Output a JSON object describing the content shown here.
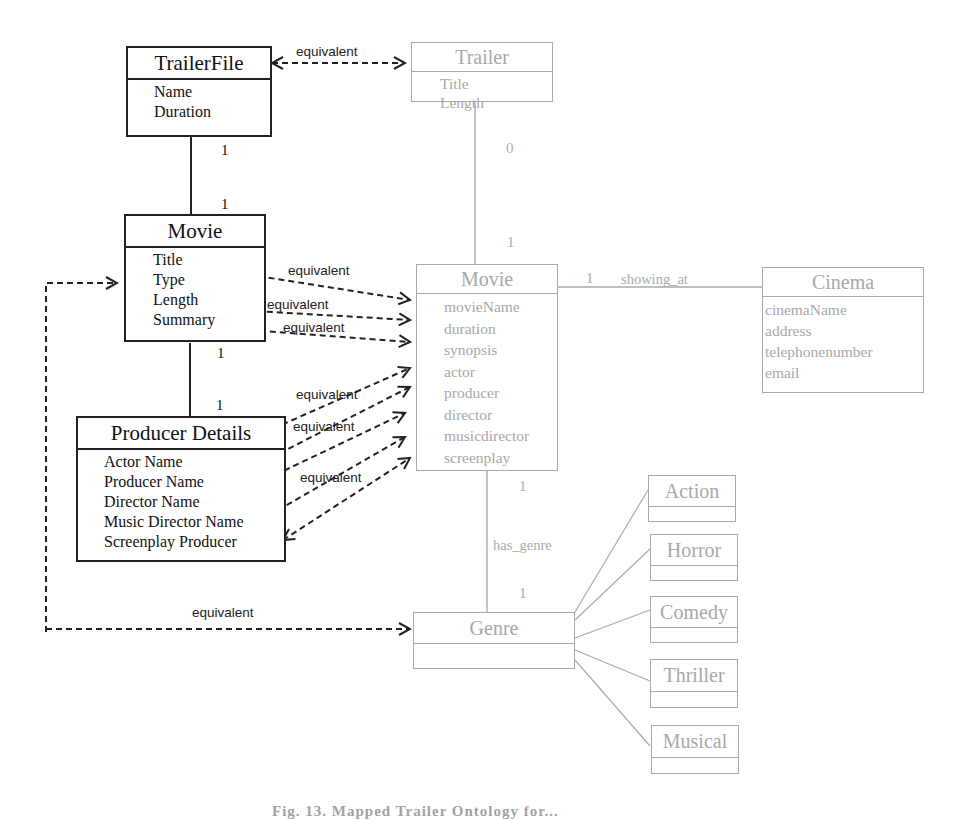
{
  "diagram": {
    "left_model": {
      "trailerfile": {
        "title": "TrailerFile",
        "attributes": [
          "Name",
          "Duration"
        ]
      },
      "movie": {
        "title": "Movie",
        "attributes": [
          "Title",
          "Type",
          "Length",
          "Summary"
        ]
      },
      "producer_details": {
        "title": "Producer Details",
        "attributes": [
          "Actor Name",
          "Producer Name",
          "Director Name",
          "Music Director Name",
          "Screenplay Producer"
        ]
      }
    },
    "right_model": {
      "trailer": {
        "title": "Trailer",
        "attributes": [
          "Title",
          "Length"
        ]
      },
      "movie": {
        "title": "Movie",
        "attributes": [
          "movieName",
          "duration",
          "synopsis",
          "actor",
          "producer",
          "director",
          "musicdirector",
          "screenplay"
        ]
      },
      "cinema": {
        "title": "Cinema",
        "attributes": [
          "cinemaName",
          "address",
          "telephonenumber",
          "email"
        ]
      },
      "genre": {
        "title": "Genre",
        "attributes": []
      },
      "subgenres": [
        {
          "title": "Action"
        },
        {
          "title": "Horror"
        },
        {
          "title": "Comedy"
        },
        {
          "title": "Thriller"
        },
        {
          "title": "Musical"
        }
      ]
    },
    "associations": {
      "showing_at": "showing_at",
      "has_genre": "has_genre"
    },
    "multiplicities": {
      "trailerfile_movie_top": "1",
      "trailerfile_movie_bottom": "1",
      "movie_producer_top": "1",
      "movie_producer_bottom": "1",
      "trailer_movie_top": "0",
      "trailer_movie_bottom": "1",
      "movie_cinema": "1",
      "movie_genre_top": "1",
      "movie_genre_bottom": "1"
    },
    "mapping_label": "equivalent",
    "mappings": [
      {
        "from": "TrailerFile",
        "to": "Trailer",
        "label": "equivalent"
      },
      {
        "from": "Movie.Title",
        "to": "Movie.movieName",
        "label": "equivalent"
      },
      {
        "from": "Movie.Length",
        "to": "Movie.duration",
        "label": "equivalent"
      },
      {
        "from": "Movie.Summary",
        "to": "Movie.synopsis",
        "label": "equivalent"
      },
      {
        "from": "Producer Details.Actor Name",
        "to": "Movie.actor",
        "label": "equivalent"
      },
      {
        "from": "Producer Details.Producer Name",
        "to": "Movie.producer",
        "label": "equivalent"
      },
      {
        "from": "Producer Details.Director Name",
        "to": "Movie.director",
        "label": ""
      },
      {
        "from": "Producer Details.Music Director Name",
        "to": "Movie.musicdirector",
        "label": "equivalent"
      },
      {
        "from": "Producer Details.Screenplay Producer",
        "to": "Movie.screenplay",
        "label": ""
      },
      {
        "from": "Movie.Type",
        "to": "Genre",
        "label": "equivalent"
      }
    ],
    "caption": "Fig. 13. Mapped Trailer Ontology for..."
  }
}
